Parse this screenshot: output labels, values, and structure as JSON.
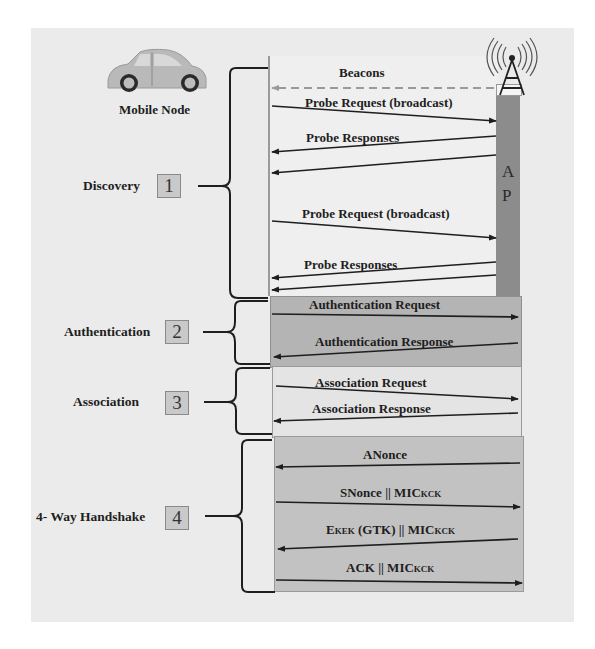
{
  "diagram": {
    "title": "",
    "actors": {
      "mobile_node": {
        "label": "Mobile Node",
        "icon": "car-icon"
      },
      "access_point": {
        "letters": [
          "A",
          "P"
        ],
        "icon": "antenna-tower-icon"
      }
    },
    "phases": [
      {
        "number": "1",
        "label": "Discovery"
      },
      {
        "number": "2",
        "label": "Authentication"
      },
      {
        "number": "3",
        "label": "Association"
      },
      {
        "number": "4",
        "label": "4- Way Handshake"
      }
    ],
    "messages": {
      "beacons": "Beacons",
      "probe_request_1": "Probe Request (broadcast)",
      "probe_responses_1": "Probe Responses",
      "probe_request_2": "Probe Request (broadcast)",
      "probe_responses_2": "Probe Responses",
      "auth_request": "Authentication Request",
      "auth_response": "Authentication Response",
      "assoc_request": "Association Request",
      "assoc_response": "Association Response",
      "anonce": "ANonce",
      "snonce_main": "SNonce || MIC",
      "snonce_sub": "KCK",
      "ekek_e": "E",
      "ekek_sub": "KEK",
      "ekek_rest": " (GTK) || MIC",
      "ekek_sub2": "KCK",
      "ack_main": "ACK || MIC",
      "ack_sub": "KCK"
    },
    "colors": {
      "background": "#ebebeb",
      "discovery_band": "#efefef",
      "auth_band": "#b4b4b4",
      "assoc_band": "#e4e4e4",
      "handshake_band": "#c2c2c2",
      "ap_bar": "#8c8c8c",
      "line": "#1e1e1e",
      "beacon_dash": "#9a9a9a"
    }
  }
}
